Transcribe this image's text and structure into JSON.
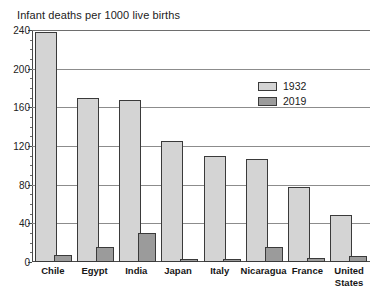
{
  "chart_data": {
    "type": "bar",
    "title": "Infant deaths per 1000 live births",
    "xlabel": "",
    "ylabel": "",
    "ylim": [
      0,
      240
    ],
    "yticks": [
      0,
      40,
      80,
      120,
      160,
      200,
      240
    ],
    "grid": true,
    "legend_position": "upper-right",
    "categories": [
      "Chile",
      "Egypt",
      "India",
      "Japan",
      "Italy",
      "Nicaragua",
      "France",
      "United States"
    ],
    "series": [
      {
        "name": "1932",
        "color": "#d4d4d4",
        "values": [
          238,
          170,
          168,
          125,
          110,
          107,
          78,
          49
        ]
      },
      {
        "name": "2019",
        "color": "#9b9b9b",
        "values": [
          7,
          16,
          30,
          2,
          3,
          16,
          4,
          6
        ]
      }
    ]
  },
  "axis": {
    "tick_labels": [
      "240",
      "200",
      "160",
      "120",
      "80",
      "40",
      "0"
    ]
  },
  "xaxis": {
    "labels": [
      "Chile",
      "Egypt",
      "India",
      "Japan",
      "Italy",
      "Nicaragua",
      "France",
      "United\nStates"
    ]
  },
  "legend": {
    "entries": [
      {
        "label": "1932"
      },
      {
        "label": "2019"
      }
    ]
  }
}
